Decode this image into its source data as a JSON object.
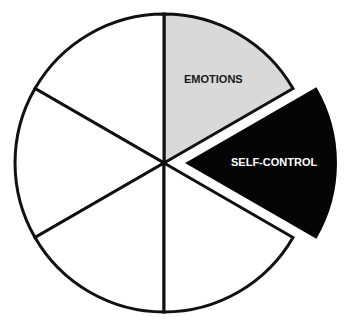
{
  "diagram": {
    "type": "pie-wheel",
    "segments": 6,
    "center": [
      164,
      163
    ],
    "radius": 149,
    "stroke_color": "#111111",
    "highlighted": [
      {
        "label": "EMOTIONS",
        "fill": "#d9d9d9",
        "text_color": "#1a1a1a",
        "exploded": false
      },
      {
        "label": "SELF-CONTROL",
        "fill": "#050505",
        "text_color": "#ffffff",
        "exploded": true
      }
    ],
    "empty_fill": "#ffffff"
  }
}
